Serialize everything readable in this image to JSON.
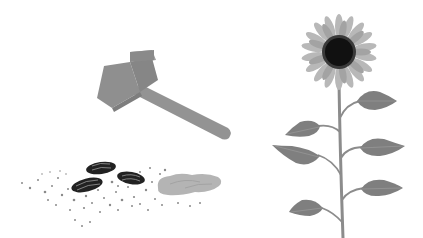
{
  "scene": {
    "description": "Grayscale illustration: a hammer above crushed sunflower seeds and pile of debris; a sunflower plant on the right",
    "colors": {
      "background": "#ffffff",
      "hammer": "#8f8f8f",
      "hammer_dark": "#7e7e7e",
      "hammer_light": "#9c9c9c",
      "seed": "#222222",
      "seed_stripe": "#9a9a9a",
      "pile": "#b4b4b4",
      "crumbs": "#8a8a8a",
      "petal": "#b8b8b8",
      "petal_dark": "#a3a3a3",
      "flower_center": "#111111",
      "center_ring": "#3a3a3a",
      "stem": "#8c8c8c",
      "leaf": "#7f7f7f",
      "leaf_vein": "#9a9a9a"
    },
    "objects": [
      "hammer",
      "sunflower-seeds",
      "crushed-pile",
      "sunflower"
    ]
  }
}
